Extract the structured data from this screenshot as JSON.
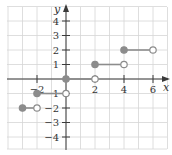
{
  "chart_data": {
    "type": "line",
    "subtype": "step-function",
    "title": "",
    "xlabel": "x",
    "ylabel": "y",
    "xlim": [
      -4,
      7
    ],
    "ylim": [
      -4.8,
      5
    ],
    "grid": true,
    "x_ticks": [
      -2,
      2,
      4,
      6
    ],
    "x_tick_labels": [
      "−2",
      "2",
      "4",
      "6"
    ],
    "y_ticks": [
      4,
      3,
      2,
      1,
      -1,
      -2,
      -3,
      -4
    ],
    "y_tick_labels": [
      "4",
      "3",
      "2",
      "1",
      "−1",
      "−2",
      "−3",
      "−4"
    ],
    "segments": [
      {
        "x_start": -3,
        "x_end": -2,
        "y": -2,
        "start_closed": true,
        "end_closed": false
      },
      {
        "x_start": -2,
        "x_end": 0,
        "y": -1,
        "start_closed": true,
        "end_closed": false
      },
      {
        "x_start": 0,
        "x_end": 2,
        "y": 0,
        "start_closed": true,
        "end_closed": false
      },
      {
        "x_start": 2,
        "x_end": 4,
        "y": 1,
        "start_closed": true,
        "end_closed": false
      },
      {
        "x_start": 4,
        "x_end": 6,
        "y": 2,
        "start_closed": true,
        "end_closed": false
      }
    ]
  },
  "colors": {
    "grid": "#d6d6d6",
    "axis": "#3a3a3a",
    "step": "#8c8c8c",
    "open_fill": "#ffffff"
  },
  "labels": {
    "x_axis": "x",
    "y_axis": "y"
  }
}
